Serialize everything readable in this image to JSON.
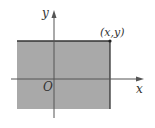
{
  "diagram": {
    "type": "coordinate-region",
    "region_color": "#a8a8a8",
    "axis_color": "#555555",
    "labels": {
      "y_axis": "y",
      "x_axis": "x",
      "origin": "O",
      "corner_point": "(x,y)"
    }
  }
}
